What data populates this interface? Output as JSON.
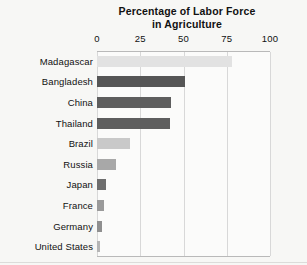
{
  "chart_data": {
    "type": "bar",
    "orientation": "horizontal",
    "title": "Percentage of Labor Force in Agriculture",
    "title_lines": [
      "Percentage of Labor Force",
      "in Agriculture"
    ],
    "xlabel": "",
    "ylabel": "",
    "xlim": [
      0,
      100
    ],
    "xticks": [
      0,
      25,
      50,
      75,
      100
    ],
    "xtick_labels": [
      "0",
      "25",
      "50",
      "75",
      "100"
    ],
    "grid": true,
    "grid_axis": "x",
    "legend": false,
    "categories": [
      "Madagascar",
      "Bangladesh",
      "China",
      "Thailand",
      "Brazil",
      "Russia",
      "Japan",
      "France",
      "Germany",
      "United States"
    ],
    "values": [
      78,
      51,
      43,
      42,
      19,
      11,
      5,
      4,
      3,
      2
    ],
    "bar_colors": [
      "#e2e2e2",
      "#565656",
      "#5e5e5e",
      "#5e5e5e",
      "#c9c9c9",
      "#a8a8a8",
      "#6e6e6e",
      "#9a9a9a",
      "#8f8f8f",
      "#b5b5b5"
    ],
    "bars": [
      {
        "label": "Madagascar",
        "value": 78,
        "color": "#e2e2e2"
      },
      {
        "label": "Bangladesh",
        "value": 51,
        "color": "#565656"
      },
      {
        "label": "China",
        "value": 43,
        "color": "#5e5e5e"
      },
      {
        "label": "Thailand",
        "value": 42,
        "color": "#5e5e5e"
      },
      {
        "label": "Brazil",
        "value": 19,
        "color": "#c9c9c9"
      },
      {
        "label": "Russia",
        "value": 11,
        "color": "#a8a8a8"
      },
      {
        "label": "Japan",
        "value": 5,
        "color": "#6e6e6e"
      },
      {
        "label": "France",
        "value": 4,
        "color": "#9a9a9a"
      },
      {
        "label": "Germany",
        "value": 3,
        "color": "#8f8f8f"
      },
      {
        "label": "United States",
        "value": 2,
        "color": "#b5b5b5"
      }
    ]
  },
  "colors": {
    "background": "#f7f7f5",
    "plot_background": "#fbfbfa",
    "gridline": "#d8d8d8",
    "frame": "#b9b9b9",
    "text": "#111111"
  }
}
